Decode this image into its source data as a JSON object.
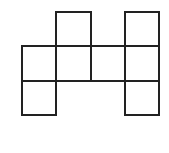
{
  "diagram": {
    "type": "cube-net",
    "grid": {
      "columns": 4,
      "rows": 3,
      "origin_x": 22,
      "origin_y": 12,
      "cell_size": 34.3
    },
    "stroke_color": "#222222",
    "fill_color": "#ffffff",
    "squares": [
      {
        "row": 0,
        "col": 1
      },
      {
        "row": 0,
        "col": 3
      },
      {
        "row": 1,
        "col": 0
      },
      {
        "row": 1,
        "col": 1
      },
      {
        "row": 1,
        "col": 2
      },
      {
        "row": 1,
        "col": 3
      },
      {
        "row": 2,
        "col": 0
      },
      {
        "row": 2,
        "col": 3
      }
    ]
  }
}
